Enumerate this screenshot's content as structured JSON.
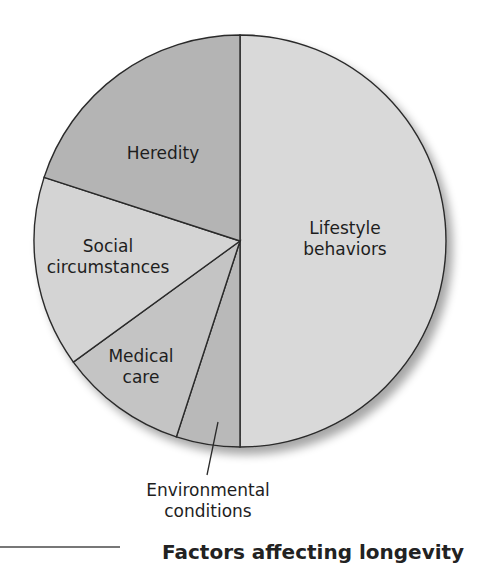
{
  "chart_data": {
    "type": "pie",
    "title": "",
    "start_angle_deg": 0,
    "direction": "clockwise",
    "categories": [
      "Lifestyle behaviors",
      "Environmental conditions",
      "Medical care",
      "Social circumstances",
      "Heredity"
    ],
    "values": [
      50,
      5,
      10,
      15,
      20
    ],
    "colors": [
      "#d9d9d9",
      "#b9b9b9",
      "#c4c4c4",
      "#d4d4d4",
      "#b4b4b4"
    ],
    "outline_color": "#2a2a2a",
    "legend": "none (labels on slices)"
  },
  "labels": {
    "lifestyle_1": "Lifestyle",
    "lifestyle_2": "behaviors",
    "heredity": "Heredity",
    "social_1": "Social",
    "social_2": "circumstances",
    "medical_1": "Medical",
    "medical_2": "care",
    "environment_1": "Environmental",
    "environment_2": "conditions"
  },
  "caption": "Factors affecting longevity"
}
